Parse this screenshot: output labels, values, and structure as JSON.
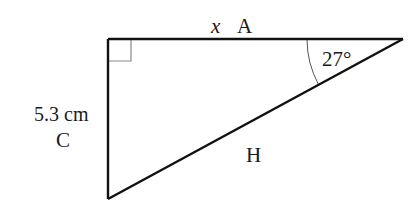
{
  "diagram": {
    "type": "right-triangle",
    "vertices": {
      "right_angle": [
        108,
        39
      ],
      "acute_top_right": [
        403,
        39
      ],
      "bottom": [
        108,
        199
      ]
    },
    "labels": {
      "top_variable": "x",
      "top_side": "A",
      "angle": "27°",
      "left_length": "5.3 cm",
      "left_side": "C",
      "hypotenuse": "H"
    },
    "colors": {
      "line": "#111111",
      "right_angle_marker": "#888888",
      "arc": "#555555",
      "text": "#1a1a1a",
      "background": "#ffffff"
    }
  }
}
